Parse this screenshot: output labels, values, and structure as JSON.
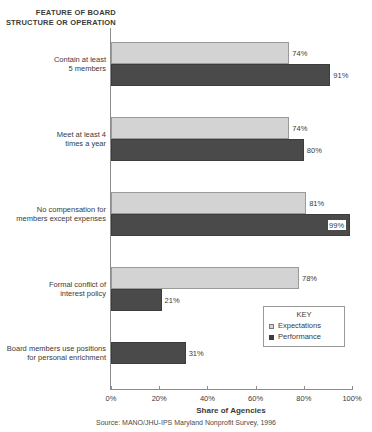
{
  "title_lines": [
    "FEATURE OF BOARD",
    "STRUCTURE OR OPERATION"
  ],
  "legend": {
    "title": "KEY",
    "items": [
      {
        "label": "Expectations",
        "key": "expectations"
      },
      {
        "label": "Performance",
        "key": "performance"
      }
    ]
  },
  "source": "Source: MANO/JHU-IPS Maryland Nonprofit Survey, 1996",
  "colors": {
    "expectations": "#d3d3d3",
    "performance": "#4a4a4a",
    "axis": "#8c8c8c",
    "text": "#3a3a3a"
  },
  "chart_data": {
    "type": "bar",
    "orientation": "horizontal",
    "title": "FEATURE OF BOARD STRUCTURE OR OPERATION",
    "xlabel": "Share of Agencies",
    "ylabel": "",
    "xlim": [
      0,
      100
    ],
    "xticks": [
      "0%",
      "20%",
      "40%",
      "60%",
      "80%",
      "100%"
    ],
    "xtick_values": [
      0,
      20,
      40,
      60,
      80,
      100
    ],
    "grid": false,
    "legend_position": "inside-lower-right",
    "categories": [
      [
        "Contain at least",
        "5 members"
      ],
      [
        "Meet at least 4",
        "times a year"
      ],
      [
        "No compensation for",
        "members except expenses"
      ],
      [
        "Formal conflict of",
        "interest policy"
      ],
      [
        "Board members use  positions",
        "for personal enrichment"
      ]
    ],
    "series": [
      {
        "name": "Expectations",
        "values": [
          74,
          74,
          81,
          78,
          null
        ],
        "labels": [
          "74%",
          "74%",
          "81%",
          "78%",
          null
        ]
      },
      {
        "name": "Performance",
        "values": [
          91,
          80,
          99,
          21,
          31
        ],
        "labels": [
          "91%",
          "80%",
          "99%",
          "21%",
          "31%"
        ],
        "label_inside": [
          false,
          false,
          true,
          false,
          false
        ]
      }
    ]
  }
}
